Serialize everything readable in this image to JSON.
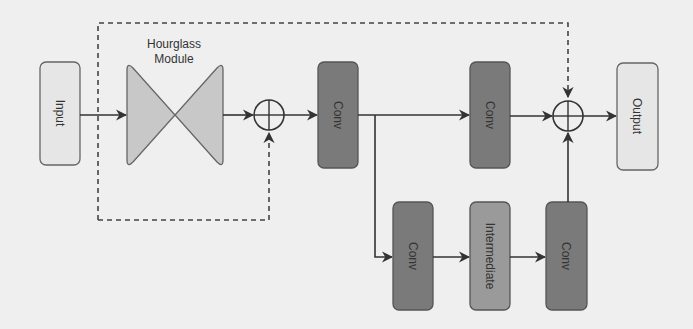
{
  "diagram": {
    "title": "Hourglass Module",
    "title_line1": "Hourglass",
    "title_line2": "Module",
    "nodes": {
      "input": "Input",
      "conv_main_1": "Conv",
      "conv_main_2": "Conv",
      "output": "Output",
      "conv_branch_1": "Conv",
      "intermediate": "Intermediate",
      "conv_branch_2": "Conv"
    },
    "colors": {
      "background": "#efefef",
      "light_box": "#e6e6e6",
      "dark_box": "#7a7a7a",
      "mid_box": "#9a9a9a",
      "hourglass": "#c8c8c8",
      "stroke": "#444444"
    }
  }
}
